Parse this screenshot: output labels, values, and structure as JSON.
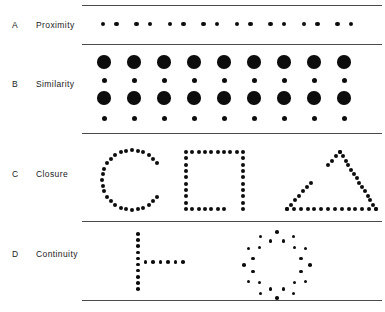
{
  "figure": {
    "background_color": "#ffffff",
    "dot_color": "#0d0d0d",
    "rule_color": "#4a4a4a",
    "width": 385,
    "height": 312
  },
  "rules": [
    {
      "name": "rule-top",
      "x": 82,
      "y": 5,
      "width": 300
    },
    {
      "name": "rule-a-b",
      "x": 82,
      "y": 44,
      "width": 300
    },
    {
      "name": "rule-b-c",
      "x": 82,
      "y": 133,
      "width": 300
    },
    {
      "name": "rule-c-d",
      "x": 82,
      "y": 221,
      "width": 300
    },
    {
      "name": "rule-bottom",
      "x": 82,
      "y": 300,
      "width": 300
    }
  ],
  "rows": [
    {
      "letter": "A",
      "label": "Proximity",
      "letter_x": 12,
      "letter_y": 20,
      "label_x": 36,
      "label_y": 20
    },
    {
      "letter": "B",
      "label": "Similarity",
      "letter_x": 12,
      "letter_y": 79,
      "label_x": 36,
      "label_y": 79
    },
    {
      "letter": "C",
      "label": "Closure",
      "letter_x": 12,
      "letter_y": 169,
      "label_x": 36,
      "label_y": 169
    },
    {
      "letter": "D",
      "label": "Continuity",
      "letter_x": 12,
      "letter_y": 249,
      "label_x": 36,
      "label_y": 249
    }
  ],
  "proximity": {
    "description": "Eight pairs of small dots; dots within a pair are close together, pairs are separated by larger gaps",
    "pair_count": 8,
    "dot_diameter": 4.6,
    "row_y": 24,
    "pair_start_x": 103,
    "pair_pitch": 33.5,
    "intra_pair_gap": 13.5
  },
  "similarity": {
    "description": "Four rows of nine dots; rows alternate between large dots and small dots",
    "columns": 9,
    "column_start_x": 104,
    "column_pitch": 30,
    "large_diameter": 13.5,
    "small_diameter": 5,
    "rows": [
      {
        "y": 62,
        "size": "large"
      },
      {
        "y": 80,
        "size": "small"
      },
      {
        "y": 98,
        "size": "large"
      },
      {
        "y": 118,
        "size": "small"
      }
    ]
  },
  "closure": {
    "description": "Three dotted outline figures, each with a gap in the contour",
    "dot_diameter": 4,
    "shapes": [
      {
        "name": "incomplete-circle",
        "type": "circle",
        "center_x": 132,
        "center_y": 180,
        "radius": 30,
        "dot_count": 32,
        "gap_start_deg": -32,
        "gap_end_deg": 32,
        "gap_side": "right"
      },
      {
        "name": "incomplete-square",
        "type": "square",
        "left": 186,
        "top": 152,
        "size": 57,
        "dots_per_side": 10,
        "gap_side": "bottom-right"
      },
      {
        "name": "incomplete-triangle",
        "type": "triangle",
        "apex_x": 340,
        "apex_y": 152,
        "base_left_x": 287,
        "base_right_x": 376,
        "base_y": 209,
        "dots_per_side": 13,
        "gap_side": "upper-left"
      }
    ]
  },
  "continuity": {
    "description": "A dotted vertical line crossed by a dotted horizontal line, and a circle of dots with alternating radii",
    "dot_diameter": 3.6,
    "shapes": [
      {
        "name": "crossing-lines",
        "type": "cross",
        "vertical_x": 138,
        "vertical_top": 234,
        "vertical_bottom": 289,
        "vertical_dot_count": 10,
        "horizontal_y": 262,
        "horizontal_left": 138,
        "horizontal_right": 183,
        "horizontal_dot_count": 7
      },
      {
        "name": "wavy-circle",
        "type": "scalloped-circle",
        "center_x": 277,
        "center_y": 265,
        "dot_count": 24,
        "radius_outer": 33,
        "radius_inner": 25
      }
    ]
  }
}
